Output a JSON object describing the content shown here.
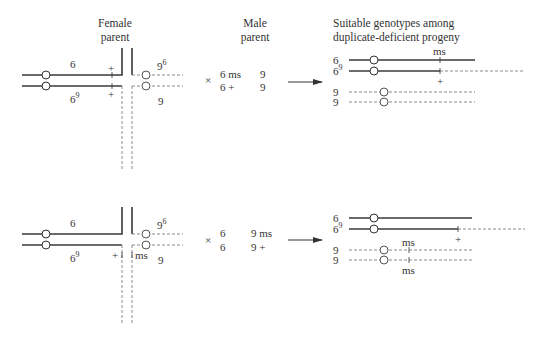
{
  "headers": {
    "female_line1": "Female",
    "female_line2": "parent",
    "male_line1": "Male",
    "male_line2": "parent",
    "progeny_line1": "Suitable genotypes among",
    "progeny_line2": "duplicate-deficient progeny"
  },
  "panels": [
    {
      "female": {
        "upper_label": "6",
        "upper_marker": "+",
        "lower_label_base": "6",
        "lower_label_sup": "9",
        "lower_marker": "+",
        "right_upper_base": "9",
        "right_upper_sup": "6",
        "right_lower": "9",
        "junction_markers": []
      },
      "cross_symbol": "×",
      "male": {
        "row1": [
          "6 ms",
          "9"
        ],
        "row2": [
          "6 +",
          "9"
        ]
      },
      "arrow": "→",
      "progeny": {
        "rows": [
          {
            "label": "6",
            "label_sup": "",
            "marker_above": "ms",
            "marker_below": ""
          },
          {
            "label": "6",
            "label_sup": "9",
            "marker_above": "",
            "marker_below": "+"
          },
          {
            "label": "9",
            "label_sup": "",
            "marker_above": "",
            "marker_below": ""
          },
          {
            "label": "9",
            "label_sup": "",
            "marker_above": "",
            "marker_below": ""
          }
        ]
      }
    },
    {
      "female": {
        "upper_label": "6",
        "lower_label_base": "6",
        "lower_label_sup": "9",
        "right_upper_base": "9",
        "right_upper_sup": "6",
        "right_lower": "9",
        "junction_left_marker": "+",
        "junction_right_marker": "ms"
      },
      "cross_symbol": "×",
      "male": {
        "row1": [
          "6",
          "9 ms"
        ],
        "row2": [
          "6",
          "9 +"
        ]
      },
      "arrow": "→",
      "progeny": {
        "rows": [
          {
            "label": "6",
            "label_sup": "",
            "marker_above": "",
            "marker_below": ""
          },
          {
            "label": "6",
            "label_sup": "9",
            "marker_above": "",
            "marker_below": "+"
          },
          {
            "label": "9",
            "label_sup": "",
            "marker_above": "ms",
            "marker_below": ""
          },
          {
            "label": "9",
            "label_sup": "",
            "marker_above": "",
            "marker_below": "ms"
          }
        ]
      }
    }
  ],
  "colors": {
    "line": "#3a3a3a",
    "dashed": "#8a8a8a",
    "text": "#333333",
    "background": "#ffffff"
  }
}
